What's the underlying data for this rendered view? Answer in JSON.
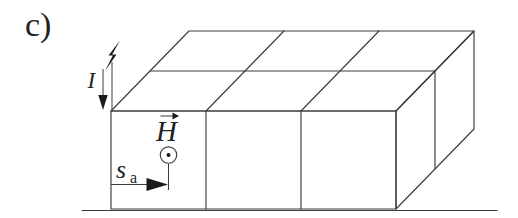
{
  "figure": {
    "part_label": "c)"
  },
  "labels": {
    "current": "I",
    "magnetic_field": "H",
    "path_base": "s",
    "path_sub": "a"
  },
  "icons": {
    "source": "lightning-bolt-icon",
    "current_direction": "down-arrow-icon",
    "field_vector_mark": "right-arrow-icon",
    "field_out_of_page": "circled-dot-icon",
    "path_direction": "right-filled-arrow-icon"
  },
  "colors": {
    "line": "#3c3c3c",
    "text": "#222222",
    "fill": "#1a1a1a",
    "background": "#ffffff"
  }
}
